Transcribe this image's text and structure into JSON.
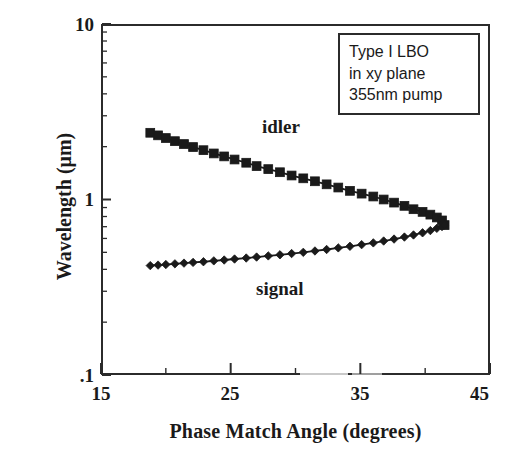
{
  "chart_data": {
    "type": "line",
    "title": "",
    "subtitle": "",
    "xlabel": "Phase Match Angle (degrees)",
    "ylabel": "Wavelength (μm)",
    "xlim": [
      15,
      45
    ],
    "ylim": [
      0.1,
      10
    ],
    "yscale": "log",
    "xscale": "linear",
    "grid": false,
    "legend_position": "inline-annotations",
    "x_ticks_major": [
      "15",
      "25",
      "35",
      "45"
    ],
    "x_ticks_major_values": [
      15,
      25,
      35,
      45
    ],
    "x_ticks_minor_values": [
      20,
      30,
      40
    ],
    "y_ticks_major": [
      "10",
      "1",
      ".1"
    ],
    "y_ticks_major_values": [
      10,
      1,
      0.1
    ],
    "annotations": [
      {
        "name": "idler-label",
        "text": "idler",
        "x": 28.2,
        "y": 3.1
      },
      {
        "name": "signal-label",
        "text": "signal",
        "x": 27.8,
        "y": 0.33
      }
    ],
    "text_box": {
      "lines": [
        "Type I LBO",
        "in xy plane",
        "355nm pump"
      ],
      "x": 33.3,
      "y": 8.2
    },
    "series": [
      {
        "name": "idler",
        "marker": "square-filled",
        "color": "#1a1a1a",
        "x": [
          18.8,
          19.4,
          20.0,
          20.7,
          21.4,
          22.1,
          22.9,
          23.7,
          24.5,
          25.3,
          26.2,
          27.0,
          27.9,
          28.8,
          29.7,
          30.6,
          31.5,
          32.4,
          33.3,
          34.2,
          35.1,
          36.0,
          36.8,
          37.6,
          38.4,
          39.1,
          39.8,
          40.4,
          40.9,
          41.3,
          41.5
        ],
        "y": [
          2.4,
          2.32,
          2.24,
          2.15,
          2.07,
          1.99,
          1.91,
          1.83,
          1.76,
          1.69,
          1.62,
          1.55,
          1.49,
          1.43,
          1.37,
          1.32,
          1.27,
          1.22,
          1.17,
          1.12,
          1.08,
          1.04,
          1.0,
          0.96,
          0.92,
          0.88,
          0.85,
          0.82,
          0.79,
          0.76,
          0.715
        ]
      },
      {
        "name": "signal",
        "marker": "diamond-filled",
        "color": "#1a1a1a",
        "x": [
          18.8,
          19.4,
          20.0,
          20.7,
          21.4,
          22.1,
          22.9,
          23.7,
          24.5,
          25.3,
          26.2,
          27.0,
          27.9,
          28.8,
          29.7,
          30.6,
          31.5,
          32.4,
          33.3,
          34.2,
          35.1,
          36.0,
          36.8,
          37.6,
          38.4,
          39.1,
          39.8,
          40.4,
          40.9,
          41.3,
          41.5
        ],
        "y": [
          0.42,
          0.423,
          0.426,
          0.43,
          0.434,
          0.438,
          0.442,
          0.447,
          0.452,
          0.458,
          0.464,
          0.47,
          0.477,
          0.484,
          0.492,
          0.5,
          0.509,
          0.519,
          0.53,
          0.541,
          0.553,
          0.566,
          0.58,
          0.595,
          0.611,
          0.628,
          0.646,
          0.665,
          0.685,
          0.702,
          0.715
        ]
      }
    ]
  },
  "axes": {
    "y_labels": {
      "top": "10",
      "mid": "1",
      "bottom": ".1"
    },
    "x_labels": {
      "t1": "15",
      "t2": "25",
      "t3": "35",
      "t4": "45"
    },
    "x_title": "Phase Match Angle (degrees)",
    "y_title": "Wavelength (μm)"
  },
  "annotation_box": {
    "line1": "Type I LBO",
    "line2": "in xy plane",
    "line3": "355nm pump"
  },
  "series_labels": {
    "idler": "idler",
    "signal": "signal"
  },
  "colors": {
    "ink": "#1a1a1a",
    "axis": "#2b2b2b",
    "background": "#ffffff"
  }
}
